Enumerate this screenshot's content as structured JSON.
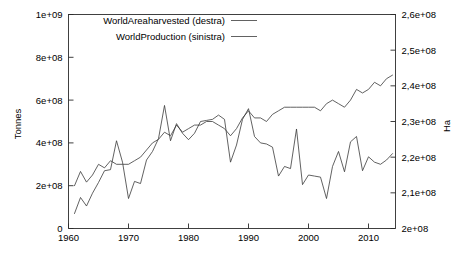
{
  "chart_data": {
    "type": "line",
    "title": "",
    "xlabel": "",
    "ylabel": "Tonnes",
    "y2label": "Ha",
    "xlim": [
      1960,
      2014.5
    ],
    "ylim": [
      0,
      1000000000
    ],
    "y2lim": [
      200000000,
      260000000
    ],
    "grid": false,
    "legend_position": "top-center",
    "x_tick_labels": [
      "1960",
      "1970",
      "1980",
      "1990",
      "2000",
      "2010"
    ],
    "x_ticks": [
      1960,
      1970,
      1980,
      1990,
      2000,
      2010
    ],
    "y_tick_labels": [
      "0",
      "2e+08",
      "4e+08",
      "6e+08",
      "8e+08",
      "1e+09"
    ],
    "y_ticks": [
      0,
      200000000,
      400000000,
      600000000,
      800000000,
      1000000000
    ],
    "y2_tick_labels": [
      "2e+08",
      "2,1e+08",
      "2,2e+08",
      "2,3e+08",
      "2,4e+08",
      "2,5e+08",
      "2,6e+08"
    ],
    "y2_ticks": [
      200000000,
      210000000,
      220000000,
      230000000,
      240000000,
      250000000,
      260000000
    ],
    "series": [
      {
        "name": "WorldAreaharvested (destra)",
        "axis": "right",
        "x": [
          1961,
          1962,
          1963,
          1964,
          1965,
          1966,
          1967,
          1968,
          1969,
          1970,
          1971,
          1972,
          1973,
          1974,
          1975,
          1976,
          1977,
          1978,
          1979,
          1980,
          1981,
          1982,
          1983,
          1984,
          1985,
          1986,
          1987,
          1988,
          1989,
          1990,
          1991,
          1992,
          1993,
          1994,
          1995,
          1996,
          1997,
          1998,
          1999,
          2000,
          2001,
          2002,
          2003,
          2004,
          2005,
          2006,
          2007,
          2008,
          2009,
          2010,
          2011,
          2012,
          2013,
          2014
        ],
        "values": [
          212000000,
          216000000,
          213000000,
          215000000,
          218000000,
          217000000,
          219000000,
          218000000,
          218000000,
          218000000,
          219000000,
          220000000,
          222000000,
          224000000,
          225000000,
          227000000,
          226000000,
          229000000,
          227000000,
          228000000,
          229000000,
          229000000,
          230000000,
          230000000,
          229000000,
          228000000,
          226000000,
          228000000,
          231000000,
          233000000,
          231000000,
          231000000,
          230000000,
          232000000,
          233000000,
          234000000,
          234000000,
          234000000,
          234000000,
          234000000,
          234000000,
          233000000,
          235000000,
          236000000,
          235000000,
          234000000,
          236000000,
          239000000,
          238000000,
          239000000,
          241000000,
          240000000,
          242000000,
          243000000
        ]
      },
      {
        "name": "WorldProduction (sinistra)",
        "axis": "left",
        "x": [
          1961,
          1962,
          1963,
          1964,
          1965,
          1966,
          1967,
          1968,
          1969,
          1970,
          1971,
          1972,
          1973,
          1974,
          1975,
          1976,
          1977,
          1978,
          1979,
          1980,
          1981,
          1982,
          1983,
          1984,
          1985,
          1986,
          1987,
          1988,
          1989,
          1990,
          1991,
          1992,
          1993,
          1994,
          1995,
          1996,
          1997,
          1998,
          1999,
          2000,
          2001,
          2002,
          2003,
          2004,
          2005,
          2006,
          2007,
          2008,
          2009,
          2010,
          2011,
          2012,
          2013,
          2014
        ],
        "values": [
          70000000,
          145000000,
          105000000,
          165000000,
          215000000,
          270000000,
          275000000,
          410000000,
          310000000,
          140000000,
          220000000,
          210000000,
          320000000,
          360000000,
          420000000,
          575000000,
          410000000,
          490000000,
          445000000,
          415000000,
          445000000,
          500000000,
          505000000,
          510000000,
          530000000,
          510000000,
          310000000,
          390000000,
          510000000,
          560000000,
          430000000,
          400000000,
          395000000,
          380000000,
          245000000,
          290000000,
          280000000,
          465000000,
          205000000,
          250000000,
          245000000,
          240000000,
          140000000,
          290000000,
          360000000,
          265000000,
          405000000,
          430000000,
          270000000,
          335000000,
          310000000,
          300000000,
          320000000,
          350000000
        ]
      }
    ]
  },
  "legend": {
    "entries": [
      {
        "label": "WorldAreaharvested (destra)"
      },
      {
        "label": "WorldProduction (sinistra)"
      }
    ]
  },
  "axes": {
    "left_title": "Tonnes",
    "right_title": "Ha"
  }
}
